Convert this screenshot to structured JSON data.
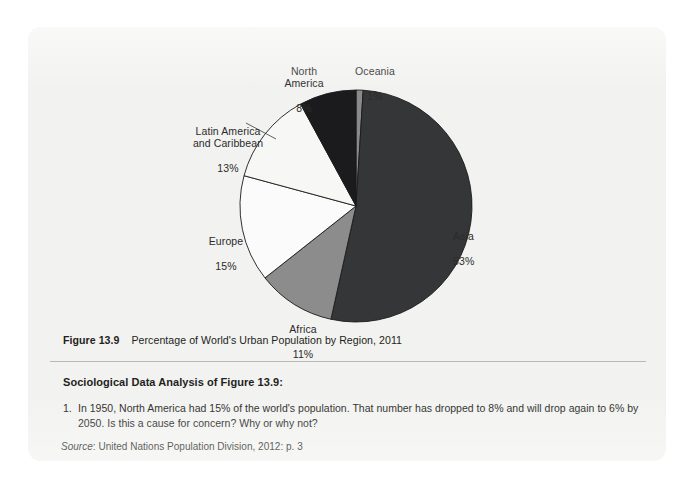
{
  "figure": {
    "number_label": "Figure 13.9",
    "caption": "Percentage of World's Urban Population by Region, 2011"
  },
  "analysis": {
    "heading": "Sociological Data Analysis of Figure 13.9:",
    "questions": [
      {
        "number": "1.",
        "text": "In 1950, North America had 15% of the world's population. That number has dropped to 8% and will drop again to 6% by 2050. Is this a cause for concern? Why or why not?"
      }
    ]
  },
  "source": {
    "prefix": "Source",
    "text": ": United Nations Population Division, 2012: p. 3"
  },
  "chart_data": {
    "type": "pie",
    "title": "Percentage of World's Urban Population by Region, 2011",
    "start_angle_deg": 0,
    "direction": "clockwise",
    "categories": [
      "Oceania",
      "Asia",
      "Africa",
      "Europe",
      "Latin America and Caribbean",
      "North America"
    ],
    "values": [
      1,
      53,
      11,
      15,
      13,
      8
    ],
    "unit": "%",
    "slices": [
      {
        "name": "Oceania",
        "label": "Oceania",
        "value": 1,
        "value_label": "1%",
        "color": "#8a8a8a",
        "stroke": "#1a1a1a"
      },
      {
        "name": "Asia",
        "label": "Asia",
        "value": 53,
        "value_label": "53%",
        "color": "#353638",
        "stroke": "#1a1a1a"
      },
      {
        "name": "Africa",
        "label": "Africa",
        "value": 11,
        "value_label": "11%",
        "color": "#8c8c8c",
        "stroke": "#1a1a1a"
      },
      {
        "name": "Europe",
        "label": "Europe",
        "value": 15,
        "value_label": "15%",
        "color": "#fbfbfb",
        "stroke": "#1a1a1a"
      },
      {
        "name": "Latin America and Caribbean",
        "label": "Latin America\nand Caribbean",
        "value": 13,
        "value_label": "13%",
        "color": "#f7f7f6",
        "stroke": "#1a1a1a"
      },
      {
        "name": "North America",
        "label": "North\nAmerica",
        "value": 8,
        "value_label": "8%",
        "color": "#1b1b1d",
        "stroke": "#1a1a1a"
      }
    ],
    "legend": "none",
    "grid": false
  },
  "colors": {
    "page_background": "#ffffff",
    "panel_background": "#f2f2f0",
    "text": "#231f20",
    "rule": "#b9b9b7"
  }
}
